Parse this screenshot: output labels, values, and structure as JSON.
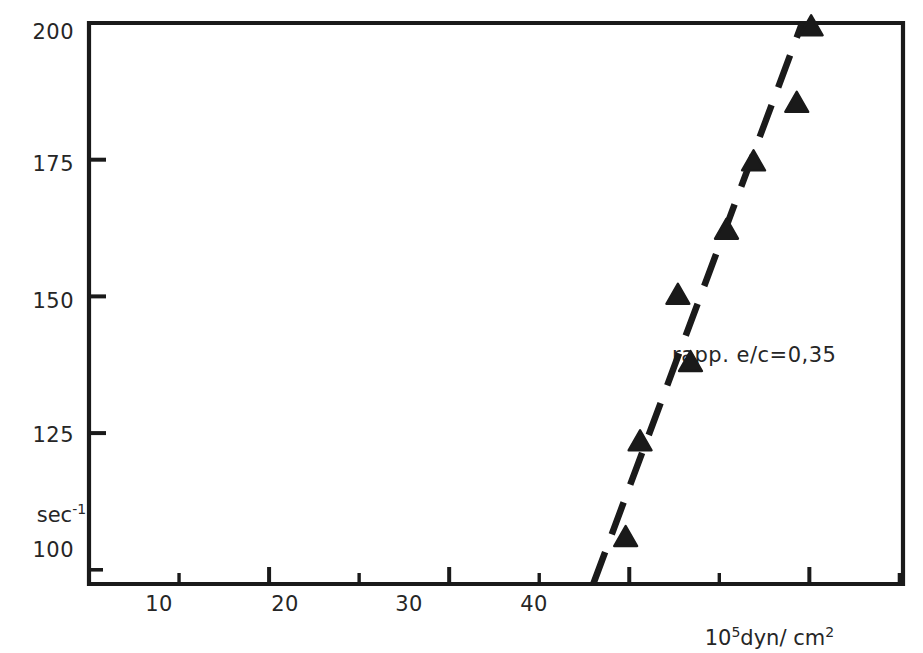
{
  "chart_data": {
    "type": "scatter",
    "title": "",
    "subtitle": "",
    "xlabel": "10⁵dyn/ cm²",
    "ylabel": "sec⁻¹",
    "xlim": [
      0,
      45.2
    ],
    "ylim": [
      97.4,
      200
    ],
    "grid": false,
    "legend": null,
    "xticks_major": [
      10,
      20,
      30,
      40
    ],
    "xticks_major_labels": [
      "10",
      "20",
      "30",
      "40"
    ],
    "xticks_minor": [
      5,
      15,
      25,
      35,
      45
    ],
    "yticks_major": [
      100,
      125,
      150,
      175,
      200
    ],
    "yticks_major_labels": [
      "100",
      "125",
      "150",
      "175",
      "200"
    ],
    "marker": "triangle-up",
    "marker_color": "#1a1a1a",
    "series": [
      {
        "name": "rapp. e/c=0,35",
        "points": [
          {
            "x": 29.8,
            "y": 106.0
          },
          {
            "x": 30.6,
            "y": 123.5
          },
          {
            "x": 32.7,
            "y": 150.3
          },
          {
            "x": 33.4,
            "y": 138.0
          },
          {
            "x": 35.4,
            "y": 162.2
          },
          {
            "x": 36.9,
            "y": 174.7
          },
          {
            "x": 39.3,
            "y": 185.4
          },
          {
            "x": 40.1,
            "y": 199.4
          }
        ]
      }
    ],
    "trend_line": {
      "style": "dashed",
      "color": "#1a1a1a",
      "x_start": 28.0,
      "y_start": 97.4,
      "x_end": 39.6,
      "y_end": 200.0
    },
    "annotations": [
      {
        "text": "rapp. e/c=0,35",
        "x": 52.0,
        "y": 153.5
      }
    ]
  },
  "axes": {
    "x_title": "10",
    "x_title_exp": "5",
    "x_title_rest": "dyn/ cm",
    "x_title_rest_exp": "2",
    "y_title": "sec",
    "y_title_exp": "-1"
  },
  "labels": {
    "y": [
      "200",
      "175",
      "150",
      "125",
      "100"
    ],
    "x": [
      "10",
      "20",
      "30",
      "40"
    ]
  }
}
